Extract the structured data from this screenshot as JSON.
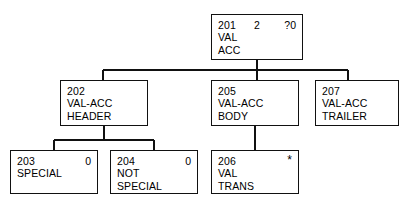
{
  "diagram": {
    "type": "structure-chart",
    "background": "#ffffff",
    "line_color": "#111111",
    "text_color": "#000000",
    "nodes": [
      {
        "key": "n201",
        "id": "201",
        "mid": "2",
        "right": "?0",
        "lines": [
          "VAL",
          "ACC"
        ],
        "x": 211,
        "y": 14,
        "w": 92,
        "h": 46
      },
      {
        "key": "n202",
        "id": "202",
        "mid": "",
        "right": "",
        "lines": [
          "VAL-ACC",
          "HEADER"
        ],
        "x": 60,
        "y": 80,
        "w": 88,
        "h": 46
      },
      {
        "key": "n205",
        "id": "205",
        "mid": "",
        "right": "",
        "lines": [
          "VAL-ACC",
          "BODY"
        ],
        "x": 211,
        "y": 80,
        "w": 88,
        "h": 46
      },
      {
        "key": "n207",
        "id": "207",
        "mid": "",
        "right": "",
        "lines": [
          "VAL-ACC",
          "TRAILER"
        ],
        "x": 315,
        "y": 80,
        "w": 84,
        "h": 46
      },
      {
        "key": "n203",
        "id": "203",
        "mid": "",
        "right": "0",
        "lines": [
          "SPECIAL"
        ],
        "x": 10,
        "y": 150,
        "w": 88,
        "h": 44
      },
      {
        "key": "n204",
        "id": "204",
        "mid": "",
        "right": "0",
        "lines": [
          "NOT",
          "SPECIAL"
        ],
        "x": 110,
        "y": 150,
        "w": 88,
        "h": 44
      },
      {
        "key": "n206",
        "id": "206",
        "mid": "",
        "right": "*",
        "lines": [
          "VAL",
          "TRANS"
        ],
        "x": 211,
        "y": 150,
        "w": 88,
        "h": 44
      }
    ],
    "connectors": [
      {
        "name": "root-to-level2-bus",
        "stub_x": 257,
        "stub_from_y": 60,
        "stub_to_y": 70,
        "bus_y": 70,
        "bus_x1": 103,
        "bus_x2": 348,
        "drops": [
          {
            "x": 103,
            "to_y": 80
          },
          {
            "x": 257,
            "to_y": 80
          },
          {
            "x": 348,
            "to_y": 80
          }
        ]
      },
      {
        "name": "header-to-children-bus",
        "stub_x": 104,
        "stub_from_y": 126,
        "stub_to_y": 140,
        "bus_y": 140,
        "bus_x1": 54,
        "bus_x2": 154,
        "drops": [
          {
            "x": 54,
            "to_y": 150
          },
          {
            "x": 154,
            "to_y": 150
          }
        ]
      },
      {
        "name": "body-to-valtrans-link",
        "stub_x": 255,
        "stub_from_y": 126,
        "stub_to_y": 150,
        "bus_y": null,
        "bus_x1": null,
        "bus_x2": null,
        "drops": []
      }
    ]
  }
}
